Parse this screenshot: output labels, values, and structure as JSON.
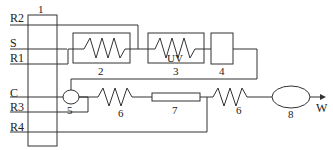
{
  "diagram": {
    "type": "process-flow-schematic",
    "blocks": [
      {
        "id": "1",
        "label": "1",
        "shape": "tall-rectangle"
      },
      {
        "id": "2",
        "label": "2",
        "shape": "box-with-coil"
      },
      {
        "id": "3",
        "label": "3",
        "shape": "box-with-coil",
        "inner_label": "UV"
      },
      {
        "id": "4",
        "label": "4",
        "shape": "box"
      },
      {
        "id": "5",
        "label": "5",
        "shape": "small-ellipse"
      },
      {
        "id": "6a",
        "label": "6",
        "shape": "coil"
      },
      {
        "id": "7",
        "label": "7",
        "shape": "narrow-rectangle"
      },
      {
        "id": "6b",
        "label": "6",
        "shape": "coil"
      },
      {
        "id": "8",
        "label": "8",
        "shape": "ellipse"
      }
    ],
    "inputs": [
      {
        "id": "R2",
        "label": "R2"
      },
      {
        "id": "S",
        "label": "S"
      },
      {
        "id": "R1",
        "label": "R1"
      },
      {
        "id": "C",
        "label": "C"
      },
      {
        "id": "R3",
        "label": "R3"
      },
      {
        "id": "R4",
        "label": "R4"
      }
    ],
    "output": {
      "id": "W",
      "label": "W"
    },
    "edges": [
      {
        "from": "R2",
        "to": "1"
      },
      {
        "from": "S",
        "to": "1"
      },
      {
        "from": "R1",
        "to": "1"
      },
      {
        "from": "C",
        "to": "1"
      },
      {
        "from": "R3",
        "to": "1"
      },
      {
        "from": "R4",
        "to": "1"
      },
      {
        "from": "1",
        "to": "2"
      },
      {
        "from": "2",
        "to": "3"
      },
      {
        "from": "1",
        "to": "3"
      },
      {
        "from": "3",
        "to": "4"
      },
      {
        "from": "4",
        "to": "5"
      },
      {
        "from": "5",
        "to": "6a"
      },
      {
        "from": "6a",
        "to": "7"
      },
      {
        "from": "7",
        "to": "6b"
      },
      {
        "from": "6b",
        "to": "8"
      },
      {
        "from": "8",
        "to": "W"
      }
    ]
  }
}
